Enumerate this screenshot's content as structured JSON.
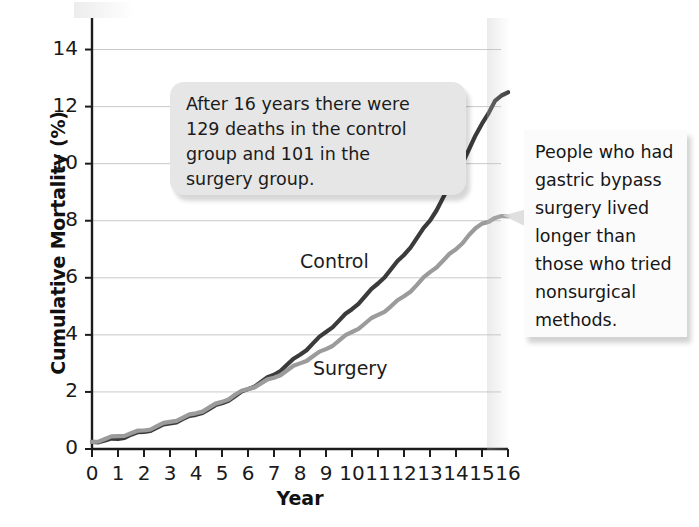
{
  "chart_data": {
    "type": "line",
    "title": "",
    "xlabel": "Year",
    "ylabel": "Cumulative Mortality (%)",
    "xlim": [
      0,
      16
    ],
    "ylim": [
      0,
      15
    ],
    "xticks": [
      "0",
      "1",
      "2",
      "3",
      "4",
      "5",
      "6",
      "7",
      "8",
      "9",
      "10",
      "11",
      "12",
      "13",
      "14",
      "15",
      "16"
    ],
    "yticks": [
      "0",
      "2",
      "4",
      "6",
      "8",
      "10",
      "12",
      "14"
    ],
    "grid": "horizontal",
    "legend": "inline-labels",
    "x": [
      0,
      0.5,
      1,
      1.5,
      2,
      2.5,
      3,
      3.5,
      4,
      4.5,
      5,
      5.5,
      6,
      6.5,
      7,
      7.5,
      8,
      8.5,
      9,
      9.5,
      10,
      10.5,
      11,
      11.5,
      12,
      12.5,
      13,
      13.5,
      14,
      14.5,
      15,
      15.5,
      16
    ],
    "series": [
      {
        "name": "Control",
        "color": "#3b3b3b",
        "values": [
          0.25,
          0.3,
          0.35,
          0.5,
          0.6,
          0.75,
          0.9,
          1.05,
          1.2,
          1.4,
          1.6,
          1.85,
          2.1,
          2.35,
          2.6,
          2.95,
          3.3,
          3.7,
          4.1,
          4.5,
          4.9,
          5.35,
          5.8,
          6.3,
          6.8,
          7.4,
          8.0,
          8.8,
          9.6,
          10.5,
          11.4,
          12.2,
          12.5
        ]
      },
      {
        "name": "Surgery",
        "color": "#9b9b9b",
        "values": [
          0.25,
          0.35,
          0.45,
          0.55,
          0.65,
          0.8,
          0.95,
          1.1,
          1.25,
          1.45,
          1.65,
          1.9,
          2.1,
          2.3,
          2.5,
          2.75,
          3.0,
          3.25,
          3.5,
          3.8,
          4.1,
          4.4,
          4.7,
          5.0,
          5.35,
          5.75,
          6.2,
          6.6,
          7.0,
          7.5,
          7.9,
          8.1,
          8.15
        ]
      }
    ],
    "series_label_control": "Control",
    "series_label_surgery": "Surgery"
  },
  "annotations": {
    "callout": {
      "line1": "After 16 years there were",
      "line2": "129 deaths in the control",
      "line3": "group and 101 in the",
      "line4": "surgery group."
    },
    "sidenote": {
      "line1": "People who had",
      "line2": "gastric bypass",
      "line3": "surgery lived",
      "line4": "longer than",
      "line5": "those who tried",
      "line6": "nonsurgical",
      "line7": "methods."
    }
  }
}
